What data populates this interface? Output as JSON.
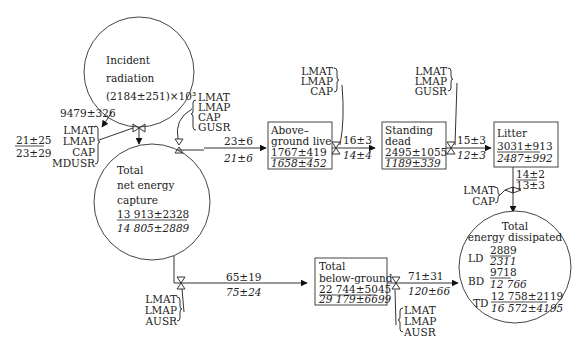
{
  "incident": {
    "line1": "Incident",
    "line2": "radiation",
    "line3": "(2184±251)×10³"
  },
  "capture_flow": {
    "value": "9479±326",
    "factors": [
      "LMAT",
      "LMAP",
      "CAP",
      "MDUSR"
    ],
    "ratio_top": "21±25",
    "ratio_bottom": "23±29"
  },
  "net_capture": {
    "line1": "Total",
    "line2": "net energy",
    "line3": "capture",
    "value_top": "13 913±2328",
    "value_bottom": "14 805±2889"
  },
  "to_aboveground": {
    "factors": [
      "LMAT",
      "LMAP",
      "CAP",
      "GUSR"
    ],
    "value_top": "23±6",
    "value_bottom": "21±6"
  },
  "aboveground": {
    "line1": "Above–",
    "line2": "ground live",
    "value_top": "1767±419",
    "value_bottom": "1658±452"
  },
  "to_standing": {
    "factors": [
      "LMAT",
      "LMAP",
      "CAP"
    ],
    "value_top": "16±3",
    "value_bottom": "14±4"
  },
  "standing": {
    "line1": "Standing",
    "line2": "dead",
    "value_top": "2495±1055",
    "value_bottom": "1189±339"
  },
  "to_litter": {
    "factors": [
      "LMAT",
      "LMAP",
      "GUSR"
    ],
    "value_top": "15±3",
    "value_bottom": "12±3"
  },
  "litter": {
    "line1": "Litter",
    "value_top": "3031±913",
    "value_bottom": "2487±992"
  },
  "litter_to_dissipated": {
    "factors": [
      "LMAT",
      "CAP"
    ],
    "value_top": "14±2",
    "value_bottom": "13±3"
  },
  "to_belowground": {
    "factors": [
      "LMAT",
      "LMAP",
      "AUSR"
    ],
    "value_top": "65±19",
    "value_bottom": "75±24"
  },
  "belowground": {
    "line1": "Total",
    "line2": "below-ground",
    "value_top": "22 744±5045",
    "value_bottom": "29 179±6699"
  },
  "below_to_dissipated": {
    "factors": [
      "LMAT",
      "LMAP",
      "AUSR"
    ],
    "value_top": "71±31",
    "value_bottom": "120±66"
  },
  "dissipated": {
    "line1": "Total",
    "line2": "energy dissipated",
    "ld_label": "LD",
    "ld_top": "2889",
    "ld_bottom": "2311",
    "bd_label": "BD",
    "bd_top": "9718",
    "bd_bottom": "12 766",
    "td_label": "TD",
    "td_top": "12 758±2119",
    "td_bottom": "16 572±4195"
  }
}
